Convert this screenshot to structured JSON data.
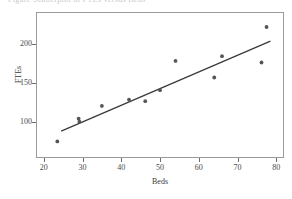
{
  "figure": {
    "clipped_caption": "Figure      Scatterplot of FTEs versus Beds",
    "background": "#ffffff",
    "frame_color": "#9a9a9a"
  },
  "chart_data": {
    "type": "scatter",
    "title": "",
    "xlabel": "Beds",
    "ylabel": "FTEs",
    "xlim": [
      18,
      82
    ],
    "ylim": [
      55,
      240
    ],
    "xticks": [
      20,
      30,
      40,
      50,
      60,
      70,
      80
    ],
    "xtick_labels": [
      "20",
      "30",
      "40",
      "50",
      "60",
      "70",
      "80"
    ],
    "yticks": [
      100,
      150,
      200
    ],
    "ytick_labels": [
      "100",
      "150",
      "200"
    ],
    "grid": false,
    "legend": "none",
    "point_color": "#555555",
    "line_color": "#3a3a3a",
    "series": [
      {
        "name": "Hospitals",
        "marker": "filled-circle",
        "x": [
          23.5,
          29.0,
          29.2,
          35.0,
          42.0,
          46.2,
          50.0,
          54.0,
          64.0,
          66.0,
          76.2,
          77.5
        ],
        "y": [
          76,
          105,
          101,
          121,
          129,
          127,
          141,
          178,
          157,
          184,
          176,
          221
        ]
      }
    ],
    "fit_line": {
      "name": "least-squares fit",
      "x_start": 24.5,
      "y_start": 89,
      "x_end": 78.5,
      "y_end": 203
    }
  }
}
